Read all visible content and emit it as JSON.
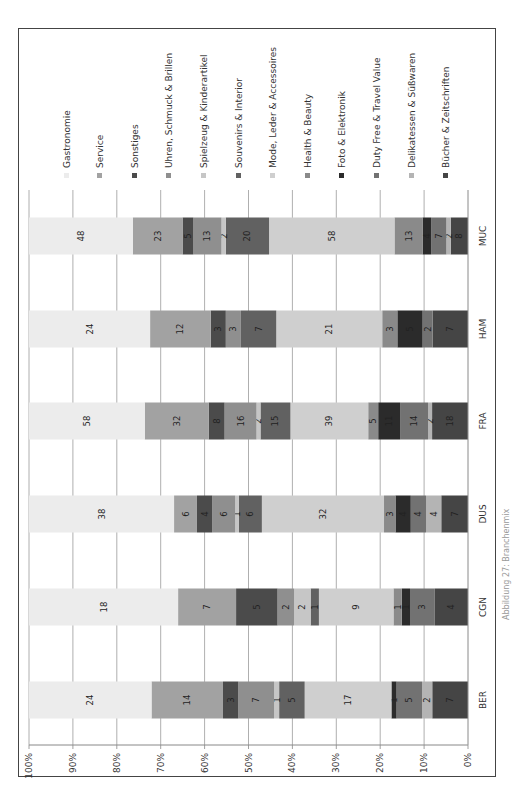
{
  "chart_data": {
    "type": "bar",
    "orientation": "stacked-100-percent, image rotated 90 degrees counter-clockwise",
    "title": "",
    "caption": "Abbildung 27: Branchenmix",
    "xlabel": "",
    "ylabel": "",
    "ylim": [
      0,
      100
    ],
    "ytick_labels": [
      "0%",
      "10%",
      "20%",
      "30%",
      "40%",
      "50%",
      "60%",
      "70%",
      "80%",
      "90%",
      "100%"
    ],
    "grid": true,
    "legend_position": "top",
    "categories": [
      "BER",
      "CGN",
      "DUS",
      "FRA",
      "HAM",
      "MUC"
    ],
    "series": [
      {
        "name": "Bücher & Zeitschriften",
        "color": "#454545",
        "values": [
          7,
          4,
          7,
          18,
          7,
          8
        ]
      },
      {
        "name": "Delikatessen & Süßwaren",
        "color": "#b4b4b4",
        "values": [
          2,
          0,
          4,
          2,
          0,
          2
        ]
      },
      {
        "name": "Duty Free & Travel Value",
        "color": "#727272",
        "values": [
          5,
          3,
          4,
          14,
          2,
          7
        ]
      },
      {
        "name": "Foto & Elektronik",
        "color": "#2b2b2b",
        "values": [
          1,
          1,
          4,
          11,
          5,
          4
        ]
      },
      {
        "name": "Health & Beauty",
        "color": "#8a8a8a",
        "values": [
          0,
          1,
          3,
          5,
          3,
          13
        ]
      },
      {
        "name": "Mode, Leder & Accessoires",
        "color": "#cfcfcf",
        "values": [
          17,
          9,
          32,
          39,
          21,
          58
        ]
      },
      {
        "name": "Souvenirs & Interior",
        "color": "#616161",
        "values": [
          5,
          1,
          6,
          15,
          7,
          20
        ]
      },
      {
        "name": "Spielzeug & Kinderartikel",
        "color": "#c6c6c6",
        "values": [
          1,
          2,
          1,
          2,
          0,
          2
        ]
      },
      {
        "name": "Uhren, Schmuck & Brillen",
        "color": "#8f8f8f",
        "values": [
          7,
          2,
          6,
          16,
          3,
          13
        ]
      },
      {
        "name": "Sonstiges",
        "color": "#4b4b4b",
        "values": [
          3,
          5,
          4,
          8,
          3,
          5
        ]
      },
      {
        "name": "Service",
        "color": "#a2a2a2",
        "values": [
          14,
          7,
          6,
          32,
          12,
          23
        ]
      },
      {
        "name": "Gastronomie",
        "color": "#ececec",
        "values": [
          24,
          18,
          38,
          58,
          24,
          48
        ]
      }
    ]
  }
}
